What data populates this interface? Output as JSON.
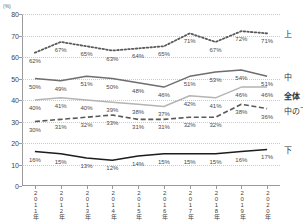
{
  "chart_data": {
    "type": "line",
    "title": "",
    "unit_label": "(%)",
    "xlabel": "",
    "ylabel": "",
    "ylim": [
      0,
      80
    ],
    "yticks": [
      0,
      10,
      20,
      30,
      40,
      50,
      60,
      70,
      80
    ],
    "grid": true,
    "legend_position": "right",
    "categories": [
      "2011年",
      "2012年",
      "2013年",
      "2014年",
      "2015年",
      "2016年",
      "2017年",
      "2018年",
      "2019年",
      "2020年"
    ],
    "series": [
      {
        "name": "上",
        "style": "dotted",
        "color": "#5a5a5a",
        "values": [
          62,
          67,
          65,
          63,
          64,
          65,
          71,
          67,
          72,
          71
        ],
        "labels": [
          "62%",
          "67%",
          "65%",
          "63%",
          "64%",
          "65%",
          "71%",
          "67%",
          "72%",
          "71%"
        ]
      },
      {
        "name": "中",
        "style": "solid",
        "color": "#6e6e6e",
        "values": [
          50,
          49,
          51,
          50,
          48,
          46,
          51,
          53,
          54,
          51
        ],
        "labels": [
          "50%",
          "49%",
          "51%",
          "50%",
          "48%",
          "46%",
          "51%",
          "53%",
          "54%",
          "51%"
        ]
      },
      {
        "name": "全体",
        "style": "solid",
        "color": "#b4b4b4",
        "values": [
          40,
          41,
          40,
          39,
          38,
          37,
          42,
          41,
          46,
          46
        ],
        "labels": [
          "40%",
          "41%",
          "40%",
          "39%",
          "38%",
          "37%",
          "42%",
          "41%",
          "46%",
          "46%"
        ]
      },
      {
        "name": "中の下",
        "style": "dashed",
        "color": "#595959",
        "values": [
          30,
          31,
          32,
          33,
          31,
          31,
          32,
          32,
          38,
          36
        ],
        "labels": [
          "30%",
          "31%",
          "32%",
          "33%",
          "31%",
          "31%",
          "32%",
          "32%",
          "38%",
          "36%"
        ]
      },
      {
        "name": "下",
        "style": "solid",
        "color": "#1c1c1c",
        "values": [
          16,
          15,
          13,
          12,
          14,
          15,
          15,
          15,
          16,
          17
        ],
        "labels": [
          "16%",
          "15%",
          "13%",
          "12%",
          "14%",
          "15%",
          "15%",
          "15%",
          "16%",
          "17%"
        ]
      }
    ]
  }
}
